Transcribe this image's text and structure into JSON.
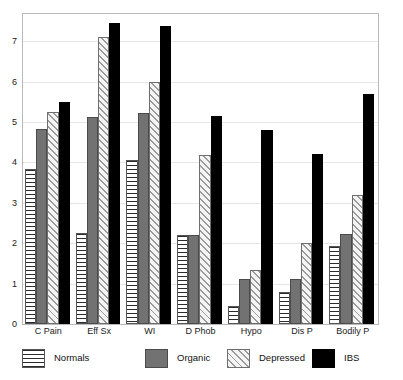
{
  "chart_data": {
    "type": "bar",
    "title": "",
    "subtitle": "",
    "xlabel": "",
    "ylabel": "",
    "ylim": [
      0,
      7.6
    ],
    "y_ticks": [
      0,
      1,
      2,
      3,
      4,
      5,
      6,
      7
    ],
    "grid": true,
    "legend_position": "bottom",
    "categories": [
      "C Pain",
      "Eff Sx",
      "WI",
      "D Phob",
      "Hypo",
      "Dis P",
      "Bodily P"
    ],
    "series": [
      {
        "name": "Normals",
        "pattern": "horizontal-stripes",
        "color": "#ffffff",
        "values": [
          3.84,
          2.25,
          4.05,
          2.2,
          0.45,
          0.8,
          1.92
        ]
      },
      {
        "name": "Organic",
        "pattern": "solid-gray",
        "color": "#727272",
        "values": [
          4.83,
          5.12,
          5.22,
          2.2,
          1.12,
          1.12,
          2.22
        ]
      },
      {
        "name": "Depressed",
        "pattern": "diagonal-hatch",
        "color": "#f2f2f2",
        "values": [
          5.25,
          7.1,
          6.0,
          4.18,
          1.33,
          2.0,
          3.2
        ]
      },
      {
        "name": "IBS",
        "pattern": "solid-black",
        "color": "#000000",
        "values": [
          5.5,
          7.45,
          7.38,
          5.15,
          4.8,
          4.2,
          5.7
        ]
      }
    ]
  }
}
